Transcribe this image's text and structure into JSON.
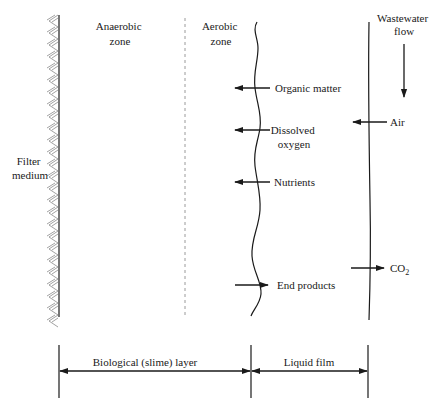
{
  "diagram": {
    "zones": {
      "anaerobic": [
        "Anaerobic",
        "zone"
      ],
      "aerobic": [
        "Aerobic",
        "zone"
      ]
    },
    "filter_medium": [
      "Filter",
      "medium"
    ],
    "wastewater_flow": [
      "Wastewater",
      "flow"
    ],
    "arrows": {
      "organic_matter": "Organic matter",
      "dissolved_oxygen": [
        "Dissolved",
        "oxygen"
      ],
      "nutrients": "Nutrients",
      "end_products": "End products",
      "air": "Air",
      "co2_main": "CO",
      "co2_sub": "2"
    },
    "dimensions": {
      "biological_layer": "Biological (slime) layer",
      "liquid_film": "Liquid film"
    }
  }
}
